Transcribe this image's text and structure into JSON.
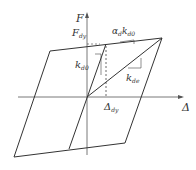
{
  "diagram": {
    "type": "hysteresis-loop",
    "axes": {
      "y_label": "F",
      "x_label": "Δ"
    },
    "labels": {
      "yield_force": {
        "main": "F",
        "sub": "dy"
      },
      "initial_stiffness": {
        "main": "k",
        "sub": "d0"
      },
      "post_yield_stiffness": {
        "main": "α",
        "sub": "d",
        "main2": "k",
        "sub2": "d0"
      },
      "effective_stiffness": {
        "main": "k",
        "sub": "de"
      },
      "yield_displacement": {
        "main": "Δ",
        "sub": "dy"
      }
    },
    "colors": {
      "line": "#333333",
      "axis": "#555555",
      "background": "#ffffff"
    }
  }
}
